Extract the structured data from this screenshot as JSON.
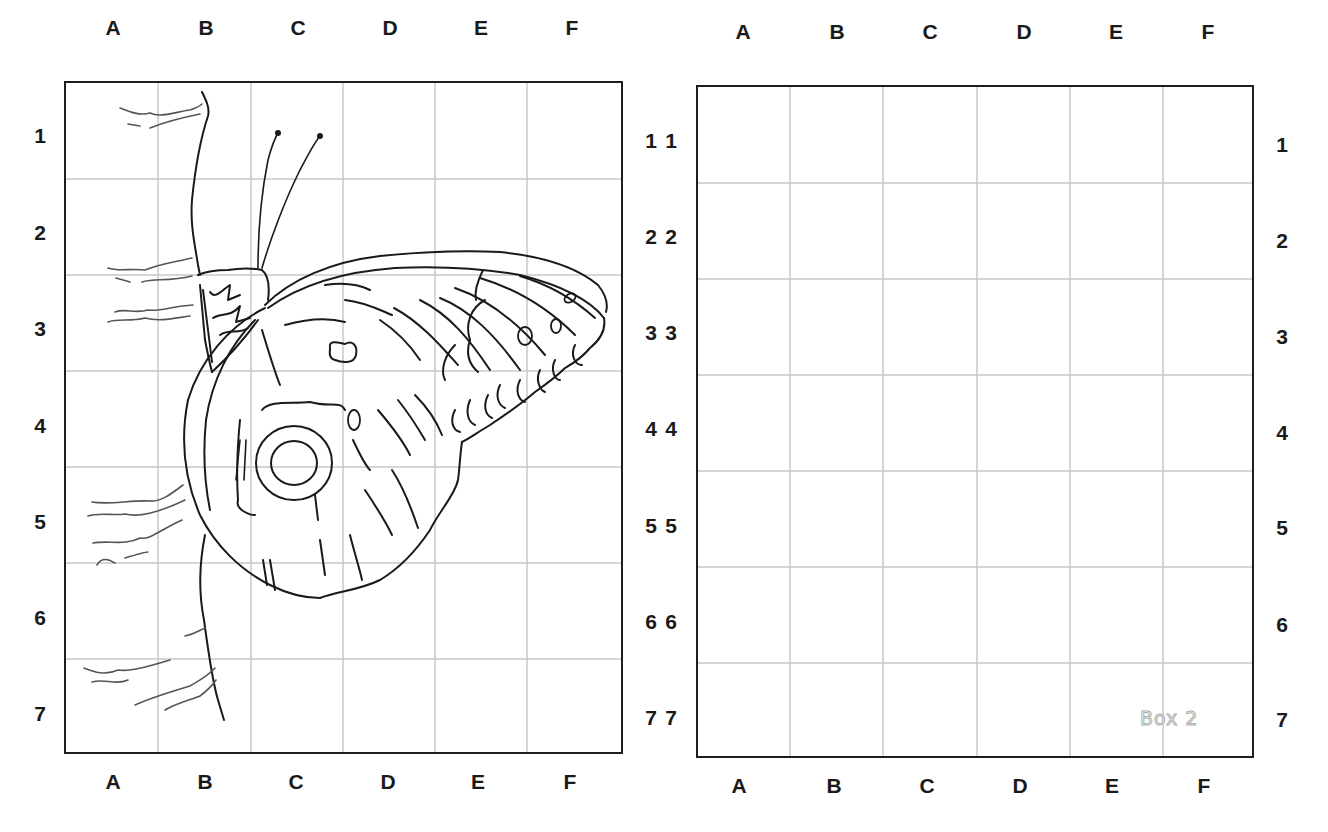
{
  "worksheet": {
    "type": "grid drawing exercise",
    "columns": [
      "A",
      "B",
      "C",
      "D",
      "E",
      "F"
    ],
    "rows": [
      "1",
      "2",
      "3",
      "4",
      "5",
      "6",
      "7"
    ],
    "grid_color": "#c8c8c8",
    "border_color": "#1e1e1e"
  },
  "box1": {
    "subject": "butterfly-on-branch-drawing",
    "top_labels": [
      "A",
      "B",
      "C",
      "D",
      "E",
      "F"
    ],
    "bottom_labels": [
      "A",
      "B",
      "C",
      "D",
      "E",
      "F"
    ],
    "left_labels": [
      "1",
      "2",
      "3",
      "4",
      "5",
      "6",
      "7"
    ],
    "right_labels": [
      "1",
      "2",
      "3",
      "4",
      "5",
      "6",
      "7"
    ]
  },
  "box2": {
    "tag": "Box 2",
    "top_labels": [
      "A",
      "B",
      "C",
      "D",
      "E",
      "F"
    ],
    "bottom_labels": [
      "A",
      "B",
      "C",
      "D",
      "E",
      "F"
    ],
    "left_labels": [
      "1",
      "2",
      "3",
      "4",
      "5",
      "6",
      "7"
    ],
    "right_labels": [
      "1",
      "2",
      "3",
      "4",
      "5",
      "6",
      "7"
    ]
  }
}
